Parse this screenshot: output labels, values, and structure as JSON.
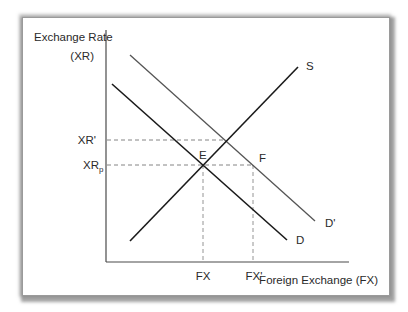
{
  "diagram": {
    "y_axis_label_line1": "Exchange Rate",
    "y_axis_label_line2": "(XR)",
    "x_axis_label": "Foreign Exchange (FX)",
    "y_ticks": {
      "xr_prime": "XR'",
      "xr_p_main": "XR",
      "xr_p_sub": "p"
    },
    "x_ticks": {
      "fx": "FX",
      "fx_prime": "FX'"
    },
    "curves": {
      "supply": "S",
      "demand": "D",
      "demand_shifted": "D'"
    },
    "points": {
      "e": "E",
      "f": "F"
    },
    "colors": {
      "primary_line": "#1a1a1a",
      "shifted_line": "#555555",
      "axis": "#4a4a4a",
      "dashed": "#777777"
    }
  }
}
